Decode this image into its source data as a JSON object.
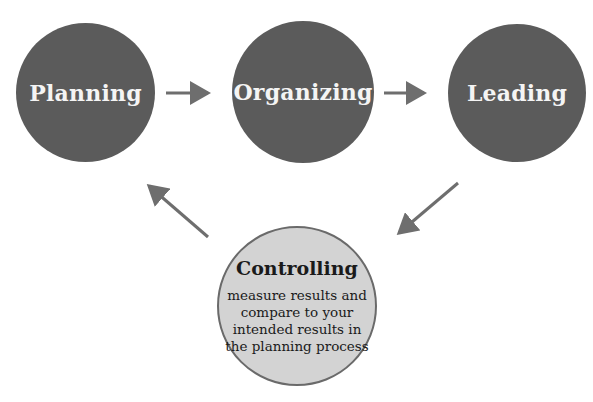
{
  "diagram": {
    "type": "cycle",
    "nodes": [
      {
        "id": "planning",
        "label": "Planning"
      },
      {
        "id": "organizing",
        "label": "Organizing"
      },
      {
        "id": "leading",
        "label": "Leading"
      },
      {
        "id": "controlling",
        "label": "Controlling",
        "description": "measure results and compare to your intended results in the planning process"
      }
    ],
    "edges": [
      {
        "from": "planning",
        "to": "organizing"
      },
      {
        "from": "organizing",
        "to": "leading"
      },
      {
        "from": "leading",
        "to": "controlling"
      },
      {
        "from": "controlling",
        "to": "planning"
      }
    ],
    "colors": {
      "dark_node": "#5b5b5b",
      "light_node": "#d3d3d3",
      "arrow": "#6e6e6e"
    }
  }
}
